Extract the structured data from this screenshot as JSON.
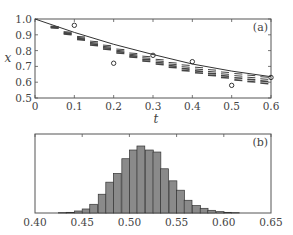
{
  "chart_data": [
    {
      "panel": "(a)",
      "type": "line",
      "xlabel": "t",
      "ylabel": "x",
      "xlim": [
        0,
        0.6
      ],
      "ylim": [
        0.5,
        1.0
      ],
      "xticks": [
        "0",
        "0.1",
        "0.2",
        "0.3",
        "0.4",
        "0.5",
        "0.6"
      ],
      "yticks": [
        "0.5",
        "0.6",
        "0.7",
        "0.8",
        "0.9",
        "1.0"
      ],
      "series": [
        {
          "name": "solid curve",
          "style": "solid",
          "x": [
            0,
            0.1,
            0.2,
            0.3,
            0.4,
            0.5,
            0.6
          ],
          "y": [
            1.0,
            0.915,
            0.84,
            0.775,
            0.715,
            0.67,
            0.635
          ]
        },
        {
          "name": "observations",
          "style": "circle",
          "x": [
            0.1,
            0.2,
            0.3,
            0.4,
            0.5,
            0.6
          ],
          "y": [
            0.96,
            0.72,
            0.77,
            0.73,
            0.58,
            0.63
          ]
        },
        {
          "name": "ensemble dashes",
          "style": "dashes",
          "x": [
            0.05,
            0.083,
            0.117,
            0.15,
            0.183,
            0.217,
            0.25,
            0.283,
            0.317,
            0.35,
            0.383,
            0.417,
            0.45,
            0.483,
            0.517,
            0.55,
            0.583
          ],
          "y_top": [
            0.955,
            0.92,
            0.89,
            0.86,
            0.835,
            0.81,
            0.785,
            0.765,
            0.745,
            0.725,
            0.71,
            0.695,
            0.68,
            0.665,
            0.655,
            0.645,
            0.635
          ],
          "y_bottom": [
            0.945,
            0.905,
            0.87,
            0.835,
            0.81,
            0.785,
            0.76,
            0.735,
            0.715,
            0.695,
            0.675,
            0.66,
            0.645,
            0.63,
            0.615,
            0.605,
            0.595
          ]
        }
      ]
    },
    {
      "panel": "(b)",
      "type": "bar",
      "xlim": [
        0.4,
        0.65
      ],
      "xticks": [
        "0.40",
        "0.45",
        "0.50",
        "0.55",
        "0.60",
        "0.65"
      ],
      "bin_width": 0.0083,
      "bin_starts": [
        0.425,
        0.433,
        0.442,
        0.45,
        0.458,
        0.467,
        0.475,
        0.483,
        0.492,
        0.5,
        0.508,
        0.517,
        0.525,
        0.533,
        0.542,
        0.55,
        0.558,
        0.567,
        0.575,
        0.583,
        0.592,
        0.6,
        0.608
      ],
      "values": [
        0.005,
        0.01,
        0.03,
        0.06,
        0.13,
        0.28,
        0.46,
        0.59,
        0.81,
        0.94,
        1.0,
        0.94,
        0.91,
        0.66,
        0.48,
        0.34,
        0.19,
        0.11,
        0.07,
        0.04,
        0.02,
        0.01,
        0.005
      ]
    }
  ],
  "labels": {
    "panel_a": "(a)",
    "panel_b": "(b)",
    "xlabel_a": "t",
    "ylabel_a": "x"
  }
}
